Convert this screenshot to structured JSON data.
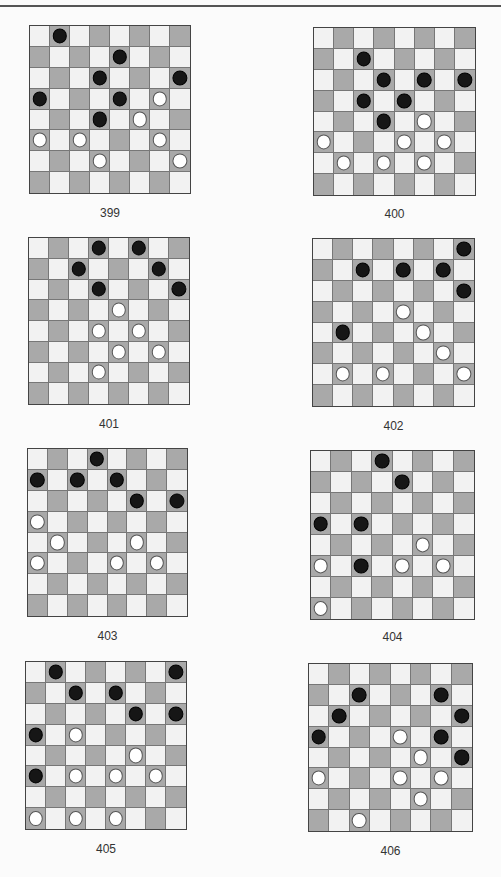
{
  "page": {
    "background": "#fbfbfb",
    "colors": {
      "light_square": "#f2f2f2",
      "dark_square": "#a9a9a9",
      "black_piece": "#161616",
      "white_piece": "#ffffff"
    }
  },
  "diagrams": [
    {
      "number": "399",
      "box": {
        "x": 29,
        "y": 25,
        "w": 162,
        "h": 169
      },
      "label_y": 213,
      "black": [
        [
          0,
          1
        ],
        [
          1,
          4
        ],
        [
          2,
          3
        ],
        [
          2,
          7
        ],
        [
          3,
          0
        ],
        [
          3,
          4
        ],
        [
          4,
          3
        ]
      ],
      "white": [
        [
          3,
          6
        ],
        [
          4,
          5
        ],
        [
          5,
          0
        ],
        [
          5,
          2
        ],
        [
          5,
          6
        ],
        [
          6,
          3
        ],
        [
          6,
          7
        ]
      ]
    },
    {
      "number": "400",
      "box": {
        "x": 313,
        "y": 27,
        "w": 163,
        "h": 169
      },
      "label_y": 214,
      "black": [
        [
          1,
          2
        ],
        [
          2,
          3
        ],
        [
          2,
          5
        ],
        [
          2,
          7
        ],
        [
          3,
          2
        ],
        [
          3,
          4
        ],
        [
          4,
          3
        ]
      ],
      "white": [
        [
          4,
          5
        ],
        [
          5,
          0
        ],
        [
          5,
          4
        ],
        [
          5,
          6
        ],
        [
          6,
          1
        ],
        [
          6,
          3
        ],
        [
          6,
          5
        ]
      ]
    },
    {
      "number": "401",
      "box": {
        "x": 28,
        "y": 237,
        "w": 162,
        "h": 168
      },
      "label_y": 424,
      "black": [
        [
          0,
          3
        ],
        [
          0,
          5
        ],
        [
          1,
          2
        ],
        [
          1,
          6
        ],
        [
          2,
          3
        ],
        [
          2,
          7
        ]
      ],
      "white": [
        [
          3,
          4
        ],
        [
          4,
          3
        ],
        [
          4,
          5
        ],
        [
          5,
          4
        ],
        [
          5,
          6
        ],
        [
          6,
          3
        ]
      ]
    },
    {
      "number": "402",
      "box": {
        "x": 312,
        "y": 238,
        "w": 163,
        "h": 169
      },
      "label_y": 426,
      "black": [
        [
          0,
          7
        ],
        [
          1,
          2
        ],
        [
          1,
          4
        ],
        [
          1,
          6
        ],
        [
          2,
          7
        ],
        [
          4,
          1
        ]
      ],
      "white": [
        [
          3,
          4
        ],
        [
          4,
          5
        ],
        [
          5,
          6
        ],
        [
          6,
          1
        ],
        [
          6,
          3
        ],
        [
          6,
          7
        ]
      ]
    },
    {
      "number": "403",
      "box": {
        "x": 27,
        "y": 448,
        "w": 161,
        "h": 169
      },
      "label_y": 636,
      "black": [
        [
          0,
          3
        ],
        [
          1,
          0
        ],
        [
          1,
          2
        ],
        [
          1,
          4
        ],
        [
          2,
          5
        ],
        [
          2,
          7
        ]
      ],
      "white": [
        [
          3,
          0
        ],
        [
          4,
          1
        ],
        [
          4,
          5
        ],
        [
          5,
          0
        ],
        [
          5,
          4
        ],
        [
          5,
          6
        ]
      ]
    },
    {
      "number": "404",
      "box": {
        "x": 310,
        "y": 450,
        "w": 165,
        "h": 170
      },
      "label_y": 637,
      "black": [
        [
          0,
          3
        ],
        [
          1,
          4
        ],
        [
          3,
          0
        ],
        [
          3,
          2
        ],
        [
          5,
          2
        ]
      ],
      "white": [
        [
          4,
          5
        ],
        [
          5,
          0
        ],
        [
          5,
          4
        ],
        [
          5,
          6
        ],
        [
          7,
          0
        ]
      ]
    },
    {
      "number": "405",
      "box": {
        "x": 25,
        "y": 661,
        "w": 162,
        "h": 169
      },
      "label_y": 849,
      "black": [
        [
          0,
          1
        ],
        [
          0,
          7
        ],
        [
          1,
          2
        ],
        [
          1,
          4
        ],
        [
          2,
          5
        ],
        [
          2,
          7
        ],
        [
          3,
          0
        ],
        [
          5,
          0
        ]
      ],
      "white": [
        [
          3,
          2
        ],
        [
          4,
          5
        ],
        [
          5,
          2
        ],
        [
          5,
          4
        ],
        [
          5,
          6
        ],
        [
          7,
          0
        ],
        [
          7,
          2
        ],
        [
          7,
          4
        ]
      ]
    },
    {
      "number": "406",
      "box": {
        "x": 308,
        "y": 663,
        "w": 165,
        "h": 169
      },
      "label_y": 851,
      "black": [
        [
          1,
          2
        ],
        [
          1,
          6
        ],
        [
          2,
          1
        ],
        [
          2,
          7
        ],
        [
          3,
          0
        ],
        [
          3,
          6
        ],
        [
          4,
          7
        ]
      ],
      "white": [
        [
          3,
          4
        ],
        [
          4,
          5
        ],
        [
          5,
          0
        ],
        [
          5,
          4
        ],
        [
          5,
          6
        ],
        [
          6,
          5
        ],
        [
          7,
          2
        ]
      ]
    }
  ]
}
